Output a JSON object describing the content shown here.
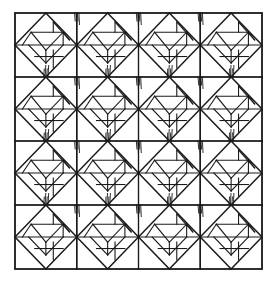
{
  "figure": {
    "name": "quilt-block-pattern",
    "title": "Patchwork Quilt Block Diagram",
    "background_color": "#ffffff",
    "ink_color": "#1a1a1a",
    "frame": {
      "x": 15,
      "y": 13,
      "width": 247,
      "height": 256,
      "stroke_width": 1.6
    },
    "grid": {
      "rows": 4,
      "columns": 4,
      "cell_width": 61.75,
      "cell_height": 64.0,
      "line_stroke_width": 1.2,
      "x_lines": [
        76.75,
        138.5,
        200.25
      ],
      "y_lines": [
        77,
        141,
        205
      ]
    },
    "block": {
      "name": "square-in-a-square-with-pinwheel",
      "description": "Each grid cell holds an inscribed diamond whose vertices touch the cell edge midpoints; the diamond is subdivided into triangles and a smaller offset square, with short dark tick strokes clustered at the shared vertices.",
      "diamond_stroke_width": 1.5,
      "inner_stroke_width": 1.1,
      "tick_stroke_width": 0.9,
      "tick_count_per_vertex": 4,
      "orientation": "uniform",
      "repeat_count": 16
    },
    "colors": {
      "ink": "#1a1a1a",
      "ink_soft": "#2b2b2b",
      "paper": "#ffffff"
    }
  },
  "chart_data": {
    "type": "diagram",
    "title": "Patchwork Quilt Block Diagram",
    "categories": [
      "row-1",
      "row-2",
      "row-3",
      "row-4"
    ],
    "values": [
      4,
      4,
      4,
      4
    ],
    "xlabel": "",
    "ylabel": "",
    "legend": []
  }
}
